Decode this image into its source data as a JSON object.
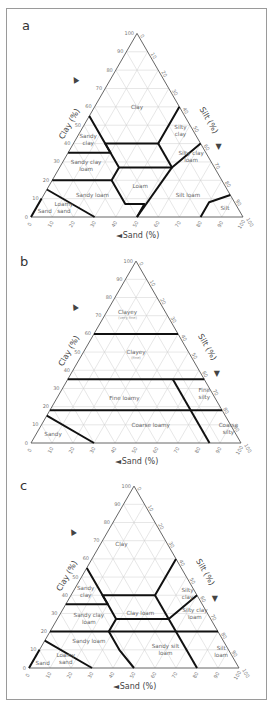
{
  "figure": {
    "panels": [
      {
        "letter": "a",
        "axis_titles": {
          "clay": "Clay (%)",
          "silt": "Silt (%)",
          "sand": "Sand (%)"
        },
        "regions": [
          {
            "label": "Clay"
          },
          {
            "label": "Sandy clay",
            "lines": [
              "Sandy",
              "clay"
            ]
          },
          {
            "label": "Silty clay",
            "lines": [
              "Silty",
              "clay"
            ]
          },
          {
            "label": "Sandy clay loam",
            "lines": [
              "Sandy clay",
              "loam"
            ]
          },
          {
            "label": "Silty clay loam",
            "lines": [
              "Silty clay",
              "loam"
            ]
          },
          {
            "label": "Loam"
          },
          {
            "label": "Sandy loam"
          },
          {
            "label": "Silt loam"
          },
          {
            "label": "Loamy sand",
            "lines": [
              "Loamy",
              "sand"
            ]
          },
          {
            "label": "Sand"
          },
          {
            "label": "Silt"
          }
        ]
      },
      {
        "letter": "b",
        "axis_titles": {
          "clay": "Clay (%)",
          "silt": "Silt (%)",
          "sand": "Sand (%)"
        },
        "regions": [
          {
            "label": "Clayey",
            "sub": "(very fine)"
          },
          {
            "label": "Clayey",
            "sub": "(fine)"
          },
          {
            "label": "Fine loamy"
          },
          {
            "label": "Fine silty",
            "lines": [
              "Fine",
              "silty"
            ]
          },
          {
            "label": "Coarse loamy"
          },
          {
            "label": "Coarse silty",
            "lines": [
              "Coarse",
              "silty"
            ]
          },
          {
            "label": "Sandy"
          }
        ]
      },
      {
        "letter": "c",
        "axis_titles": {
          "clay": "Clay (%)",
          "silt": "Silt (%)",
          "sand": "Sand (%)"
        },
        "regions": [
          {
            "label": "Clay"
          },
          {
            "label": "Sandy clay",
            "lines": [
              "Sandy",
              "clay"
            ]
          },
          {
            "label": "Silty clay",
            "lines": [
              "Silty",
              "clay"
            ]
          },
          {
            "label": "Sandy clay loam",
            "lines": [
              "Sandy clay",
              "loam"
            ]
          },
          {
            "label": "Clay loam"
          },
          {
            "label": "Silty clay loam",
            "lines": [
              "Silty clay",
              "loam"
            ]
          },
          {
            "label": "Sandy loam"
          },
          {
            "label": "Sandy silt loam",
            "lines": [
              "Sandy silt",
              "loam"
            ]
          },
          {
            "label": "Silt loam",
            "lines": [
              "Silt",
              "loam"
            ]
          },
          {
            "label": "Loamy sand",
            "lines": [
              "Loamy",
              "sand"
            ]
          },
          {
            "label": "Sand"
          }
        ]
      }
    ],
    "ticks": [
      "0",
      "10",
      "20",
      "30",
      "40",
      "50",
      "60",
      "70",
      "80",
      "90",
      "100"
    ]
  }
}
